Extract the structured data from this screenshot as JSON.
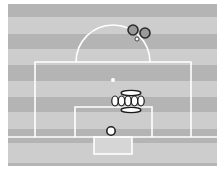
{
  "diagram": {
    "type": "football-free-kick-setup",
    "colors": {
      "background": "#ffffff",
      "stripe_dark": "#b4b4b4",
      "stripe_light": "#cdcdcd",
      "lines": "#ffffff",
      "goal_fill": "#d6d6d6",
      "attacker_fill": "#9a9a9a",
      "attacker_stroke": "#2a2a2a",
      "defender_fill": "#ffffff",
      "defender_stroke": "#1a1a1a",
      "ball_fill": "#ffffff",
      "ball_stroke": "#222222"
    },
    "field": {
      "x": 8,
      "y": 4,
      "width": 209,
      "height": 162
    },
    "stripes": [
      {
        "y": 4,
        "h": 13,
        "tone": "dark"
      },
      {
        "y": 17,
        "h": 17,
        "tone": "light"
      },
      {
        "y": 34,
        "h": 15,
        "tone": "dark"
      },
      {
        "y": 49,
        "h": 16,
        "tone": "light"
      },
      {
        "y": 65,
        "h": 16,
        "tone": "dark"
      },
      {
        "y": 81,
        "h": 16,
        "tone": "light"
      },
      {
        "y": 97,
        "h": 15,
        "tone": "dark"
      },
      {
        "y": 112,
        "h": 17,
        "tone": "light"
      },
      {
        "y": 129,
        "h": 9,
        "tone": "dark"
      },
      {
        "y": 138,
        "h": 5,
        "tone": "dark"
      },
      {
        "y": 143,
        "h": 20,
        "tone": "light"
      },
      {
        "y": 163,
        "h": 3,
        "tone": "dark"
      }
    ],
    "markings": {
      "goal_line_y": 137,
      "penalty_box": {
        "x1": 35,
        "x2": 191,
        "y_top": 62
      },
      "goal_area": {
        "x1": 75,
        "x2": 152,
        "y_top": 107
      },
      "penalty_arc": {
        "cx": 113,
        "cy": 62,
        "r": 37
      },
      "penalty_spot": {
        "cx": 113,
        "cy": 80,
        "r": 2
      },
      "goal": {
        "x": 94,
        "y": 137,
        "width": 38,
        "height": 17
      }
    },
    "attackers": [
      {
        "label": "attacker-1",
        "cx": 133,
        "cy": 30,
        "r": 5
      },
      {
        "label": "attacker-2",
        "cx": 145,
        "cy": 33,
        "r": 5
      }
    ],
    "free_kick_ball": {
      "cx": 137,
      "cy": 39,
      "r": 2
    },
    "wall": [
      {
        "label": "wall-player-1",
        "cx": 115,
        "cy": 101,
        "rx": 3.2,
        "ry": 5
      },
      {
        "label": "wall-player-2",
        "cx": 121.5,
        "cy": 101,
        "rx": 3.2,
        "ry": 5
      },
      {
        "label": "wall-player-3",
        "cx": 128,
        "cy": 101,
        "rx": 3.2,
        "ry": 5
      },
      {
        "label": "wall-player-4",
        "cx": 134.5,
        "cy": 101,
        "rx": 3.2,
        "ry": 5
      },
      {
        "label": "wall-player-5",
        "cx": 141,
        "cy": 101,
        "rx": 3.2,
        "ry": 5
      }
    ],
    "wall_arms": [
      {
        "label": "wall-top-bar",
        "cx": 131,
        "cy": 93,
        "rx": 10,
        "ry": 2.6
      },
      {
        "label": "wall-bottom-bar",
        "cx": 131,
        "cy": 110,
        "rx": 10,
        "ry": 2.6
      }
    ],
    "goalkeeper": {
      "label": "goalkeeper",
      "cx": 111,
      "cy": 131,
      "r": 4.2
    }
  }
}
